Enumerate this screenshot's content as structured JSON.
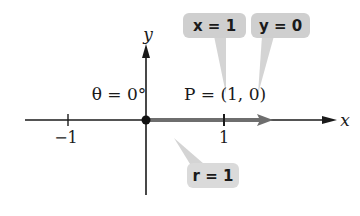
{
  "diagram": {
    "theta_label": "θ = 0°",
    "point_label": "P = (1, 0)",
    "axes": {
      "x_label": "x",
      "y_label": "y",
      "ticks": [
        {
          "value": -1,
          "label": "−1"
        },
        {
          "value": 1,
          "label": "1"
        }
      ]
    },
    "callouts": {
      "x": "x = 1",
      "y": "y = 0",
      "r": "r = 1"
    },
    "colors": {
      "axis": "#1a1a1a",
      "ray": "#6e6e6e",
      "callout_fill": "#cfcfcf",
      "background": "#ffffff"
    }
  }
}
